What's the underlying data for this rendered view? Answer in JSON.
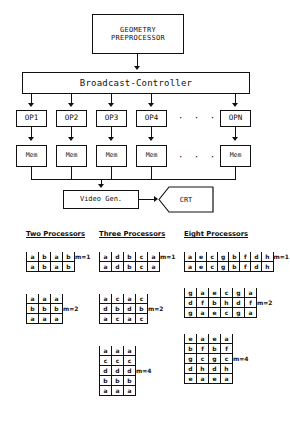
{
  "diagram": {
    "title_boxes": {
      "geometry_line1": "GEOMETRY",
      "geometry_line2": "PREPROCESSOR",
      "broadcast": "Broadcast-Controller",
      "video_gen": "Video Gen.",
      "crt": "CRT"
    },
    "processors": [
      {
        "op": "OP1",
        "mem": "Mem"
      },
      {
        "op": "OP2",
        "mem": "Mem"
      },
      {
        "op": "OP3",
        "mem": "Mem"
      },
      {
        "op": "OP4",
        "mem": "Mem"
      },
      {
        "op": "OPN",
        "mem": "Mem"
      }
    ],
    "ellipsis": "· · ·"
  },
  "tables": [
    {
      "heading": "Two Processors",
      "blocks": [
        {
          "label": "m=1",
          "rows": [
            [
              "a",
              "b",
              "a",
              "b"
            ],
            [
              "a",
              "b",
              "a",
              "b"
            ]
          ]
        },
        {
          "label": "m=2",
          "rows": [
            [
              "a",
              "a",
              "a"
            ],
            [
              "b",
              "b",
              "b"
            ],
            [
              "a",
              "a",
              "a"
            ]
          ]
        }
      ]
    },
    {
      "heading": "Three Processors",
      "blocks": [
        {
          "label": "m=1",
          "rows": [
            [
              "a",
              "d",
              "b",
              "c",
              "a"
            ],
            [
              "a",
              "d",
              "b",
              "c",
              "a"
            ]
          ]
        },
        {
          "label": "m=2",
          "rows": [
            [
              "a",
              "c",
              "a",
              "c"
            ],
            [
              "d",
              "b",
              "d",
              "b"
            ],
            [
              "a",
              "c",
              "a",
              "c"
            ]
          ]
        },
        {
          "label": "m=4",
          "rows": [
            [
              "a",
              "a",
              "a"
            ],
            [
              "c",
              "c",
              "c"
            ],
            [
              "d",
              "d",
              "d"
            ],
            [
              "b",
              "b",
              "b"
            ],
            [
              "a",
              "a",
              "a"
            ]
          ]
        }
      ]
    },
    {
      "heading": "Eight Processors",
      "blocks": [
        {
          "label": "m=1",
          "rows": [
            [
              "a",
              "e",
              "c",
              "g",
              "b",
              "f",
              "d",
              "h"
            ],
            [
              "a",
              "e",
              "c",
              "g",
              "b",
              "f",
              "d",
              "h"
            ]
          ]
        },
        {
          "label": "m=2",
          "rows": [
            [
              "g",
              "a",
              "e",
              "c",
              "g",
              "a"
            ],
            [
              "d",
              "f",
              "b",
              "h",
              "d",
              "f"
            ],
            [
              "g",
              "a",
              "e",
              "c",
              "g",
              "a"
            ]
          ]
        },
        {
          "label": "m=4",
          "rows": [
            [
              "e",
              "a",
              "e",
              "a"
            ],
            [
              "b",
              "f",
              "b",
              "f"
            ],
            [
              "g",
              "c",
              "g",
              "c"
            ],
            [
              "d",
              "h",
              "d",
              "h"
            ],
            [
              "e",
              "a",
              "e",
              "a"
            ]
          ]
        }
      ]
    }
  ]
}
